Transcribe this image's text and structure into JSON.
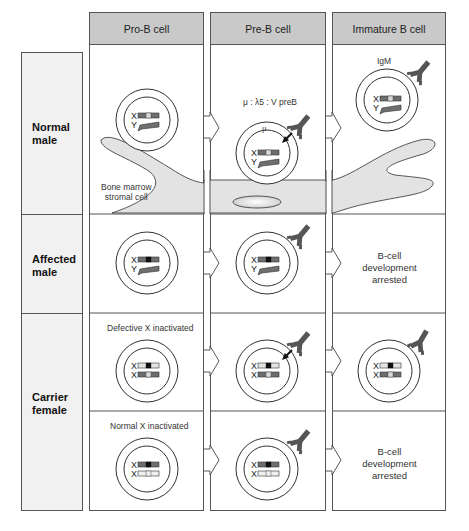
{
  "figure": {
    "columns": [
      {
        "id": "pro-b",
        "label": "Pro-B  cell"
      },
      {
        "id": "pre-b",
        "label": "Pre-B  cell"
      },
      {
        "id": "immature-b",
        "label": "Immature  B  cell"
      }
    ],
    "rows": [
      {
        "id": "normal-male",
        "label_line1": "Normal",
        "label_line2": "male"
      },
      {
        "id": "affected-male",
        "label_line1": "Affected",
        "label_line2": "male"
      },
      {
        "id": "carrier-female",
        "label_line1": "Carrier",
        "label_line2": "female"
      }
    ],
    "captions": {
      "stromal_line1": "Bone  marrow",
      "stromal_line2": "stromal  cell",
      "pre_b_receptor": "μ : λ5 : V preB",
      "mu": "μ",
      "igm": "IgM",
      "defective_x": "Defective  X  inactivated",
      "normal_x": "Normal  X  inactivated"
    },
    "arrested": {
      "line1": "B-cell",
      "line2": "development",
      "line3": "arrested"
    },
    "chromosome_labels": {
      "x": "X",
      "y": "Y"
    },
    "colors": {
      "header_fill": "#c9c9c9",
      "label_fill": "#f1f1f1",
      "stromal_fill": "#e3e3e3",
      "chromosome_dark": "#6e6e6e",
      "chromosome_light": "#d8d8d8",
      "btk_defect": "#111111",
      "antibody": "#555555",
      "border": "#555555"
    }
  }
}
